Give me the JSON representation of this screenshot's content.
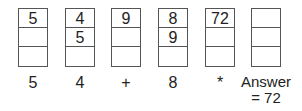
{
  "stacks": [
    {
      "cells": [
        "5",
        "",
        ""
      ]
    },
    {
      "cells": [
        "4",
        "5",
        ""
      ]
    },
    {
      "cells": [
        "9",
        "",
        ""
      ]
    },
    {
      "cells": [
        "8",
        "9",
        ""
      ]
    },
    {
      "cells": [
        "72",
        "",
        ""
      ]
    },
    {
      "cells": [
        "",
        "",
        ""
      ]
    }
  ],
  "tokens": [
    "5",
    "4",
    "+",
    "8",
    "*"
  ],
  "answer": {
    "line1": "Answer",
    "line2": "= 72"
  }
}
